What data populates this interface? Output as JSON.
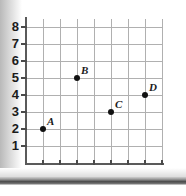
{
  "chart_data": {
    "type": "scatter",
    "title": "",
    "xlabel": "",
    "ylabel": "",
    "xlim": [
      0,
      8
    ],
    "ylim": [
      0,
      8
    ],
    "grid": true,
    "legend": "none",
    "x_ticks": [
      "1",
      "2",
      "3",
      "4",
      "5",
      "6",
      "7",
      "8"
    ],
    "y_ticks": [
      "1",
      "2",
      "3",
      "4",
      "5",
      "6",
      "7",
      "8"
    ],
    "x_tick_values": [
      1,
      2,
      3,
      4,
      5,
      6,
      7,
      8
    ],
    "y_tick_values": [
      1,
      2,
      3,
      4,
      5,
      6,
      7,
      8
    ],
    "points": [
      {
        "label": "A",
        "x": 1,
        "y": 2
      },
      {
        "label": "B",
        "x": 3,
        "y": 5
      },
      {
        "label": "C",
        "x": 5,
        "y": 3
      },
      {
        "label": "D",
        "x": 7,
        "y": 4
      }
    ],
    "colors": {
      "point": "#111111",
      "grid": "#b0b0b0",
      "axis": "#5a5a5a",
      "text": "#1b1b1b",
      "background": "#ffffff"
    }
  }
}
